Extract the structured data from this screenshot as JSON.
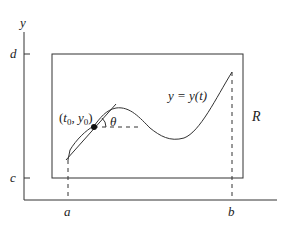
{
  "diagram": {
    "axes": {
      "x_label": "",
      "y_label": "y",
      "x_ticks": [
        {
          "label": "a",
          "x": 68
        },
        {
          "label": "b",
          "x": 232
        }
      ],
      "y_ticks": [
        {
          "label": "d",
          "y": 54
        },
        {
          "label": "c",
          "y": 178
        }
      ]
    },
    "region": {
      "label": "R"
    },
    "curve": {
      "label": "y = y(t)"
    },
    "point": {
      "label_t": "t",
      "label_t_sub": "0",
      "label_y": "y",
      "label_y_sub": "0",
      "label": "(t0, y0)"
    },
    "angle": {
      "label": "θ"
    },
    "colors": {
      "stroke": "#333333",
      "background": "#ffffff"
    }
  }
}
